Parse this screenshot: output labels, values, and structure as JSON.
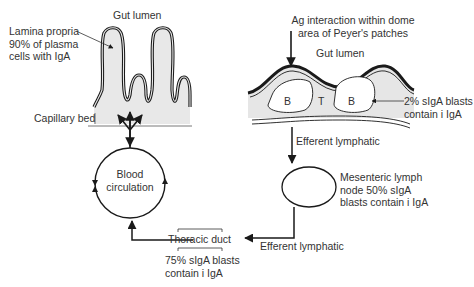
{
  "diagram": {
    "left_panel": {
      "gut_lumen": "Gut lumen",
      "lamina_propria": [
        "Lamina propria",
        "90% of plasma",
        "cells with IgA"
      ],
      "capillary_bed": "Capillary bed",
      "blood_circulation": [
        "Blood",
        "circulation"
      ]
    },
    "right_panel": {
      "ag_interaction": [
        "Ag interaction within dome",
        "area of Peyer's patches"
      ],
      "gut_lumen": "Gut lumen",
      "follicle_b1": "B",
      "follicle_t": "T",
      "follicle_b2": "B",
      "blasts_note": [
        "2% sIgA blasts",
        "contain i IgA"
      ],
      "efferent_lymphatic_1": "Efferent lymphatic",
      "mesenteric_node": [
        "Mesenteric lymph",
        "node 50% sIgA",
        "blasts contain i IgA"
      ],
      "efferent_lymphatic_2": "Efferent lymphatic"
    },
    "bottom": {
      "thoracic_duct": "Thoracic duct",
      "thoracic_note": [
        "75% sIgA blasts",
        "contain i IgA"
      ]
    },
    "colors": {
      "stroke": "#1a1a1a",
      "tissue_fill": "#e6e6e6",
      "text": "#333333"
    }
  }
}
